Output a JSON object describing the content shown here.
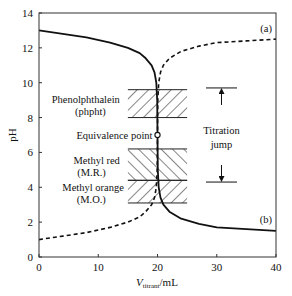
{
  "chart_data": {
    "type": "line",
    "title": "",
    "xlabel_main": "V",
    "xlabel_sub": "titrant",
    "xlabel_unit": "/mL",
    "ylabel": "pH",
    "xlim": [
      0,
      40
    ],
    "ylim": [
      0,
      14
    ],
    "x_ticks": [
      0,
      10,
      20,
      30,
      40
    ],
    "y_ticks": [
      0,
      2,
      4,
      6,
      8,
      10,
      12,
      14
    ],
    "grid": false,
    "series": [
      {
        "name": "(a)",
        "style": "dashed",
        "label_text": "(a)",
        "x": [
          0,
          4,
          8,
          12,
          15,
          17,
          18,
          19,
          19.5,
          19.8,
          19.95,
          20,
          20.05,
          20.2,
          20.5,
          21,
          22,
          24,
          27,
          30,
          35,
          40
        ],
        "y": [
          1.0,
          1.2,
          1.4,
          1.7,
          2.0,
          2.3,
          2.6,
          3.0,
          3.4,
          4.0,
          5.0,
          7.0,
          9.0,
          10.0,
          10.6,
          11.0,
          11.4,
          11.8,
          12.1,
          12.3,
          12.4,
          12.5
        ]
      },
      {
        "name": "(b)",
        "style": "solid",
        "label_text": "(b)",
        "x": [
          0,
          4,
          8,
          12,
          15,
          17,
          18,
          19,
          19.5,
          19.8,
          19.95,
          20,
          20.05,
          20.2,
          20.5,
          21,
          22,
          24,
          27,
          30,
          35,
          40
        ],
        "y": [
          13.0,
          12.8,
          12.6,
          12.3,
          12.0,
          11.7,
          11.4,
          11.0,
          10.6,
          10.0,
          9.0,
          7.0,
          5.0,
          4.0,
          3.4,
          3.0,
          2.6,
          2.2,
          1.9,
          1.7,
          1.6,
          1.5
        ]
      }
    ],
    "indicator_ranges": [
      {
        "name": "phenolphthalein",
        "label_line1": "Phenolphthalein",
        "label_line2": "(phpht)",
        "ph_low": 8.0,
        "ph_high": 9.6,
        "hatch": "forward"
      },
      {
        "name": "methyl-red",
        "label_line1": "Methyl red",
        "label_line2": "(M.R.)",
        "ph_low": 4.4,
        "ph_high": 6.2,
        "hatch": "backward"
      },
      {
        "name": "methyl-orange",
        "label_line1": "Methyl orange",
        "label_line2": "(M.O.)",
        "ph_low": 3.1,
        "ph_high": 4.4,
        "hatch": "forward"
      }
    ],
    "indicator_box_x_range": [
      15,
      25
    ],
    "equivalence_point": {
      "label": "Equivalence point",
      "x": 20,
      "y": 7.0
    },
    "titration_jump": {
      "label_line1": "Titration",
      "label_line2": "jump",
      "ph_high": 9.7,
      "ph_low": 4.3
    }
  }
}
